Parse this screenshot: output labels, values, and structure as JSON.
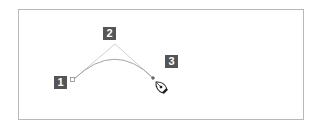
{
  "diagram": {
    "badges": [
      {
        "label": "1",
        "refers_to": "anchor-point"
      },
      {
        "label": "2",
        "refers_to": "direction-handle"
      },
      {
        "label": "3",
        "refers_to": "pen-tool-cursor"
      }
    ],
    "colors": {
      "badge_bg": "#555555",
      "badge_text": "#ffffff",
      "frame_border": "#b8b8b8",
      "curve": "#9a9a9a",
      "handle_line": "#c4c4c4"
    }
  }
}
